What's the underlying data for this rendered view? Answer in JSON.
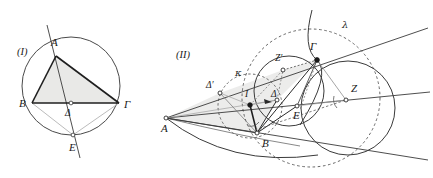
{
  "document": {
    "kind": "geometry-figure-plate",
    "width": 433,
    "height": 178,
    "background_color": "#ffffff"
  },
  "panels": [
    {
      "id": "panel-1",
      "caption": "(I)",
      "caption_x": 17,
      "caption_y": 55,
      "description": "Triangle ABΓ inscribed in a circle with cevian from A through Δ meeting the circle at E"
    },
    {
      "id": "panel-2",
      "caption": "(II)",
      "caption_x": 176,
      "caption_y": 58,
      "description": "Extended configuration with circles kappa and lambda, points A B Γ Δ Δ' E Z Z' I"
    }
  ],
  "figure1": {
    "circle": {
      "cx": 71,
      "cy": 86,
      "r": 49,
      "stroke": "#4a4a4a"
    },
    "triangle_fill": "#e9e9e7",
    "points": [
      {
        "name": "A",
        "label": "Α",
        "x": 56,
        "y": 56,
        "lx": 51,
        "ly": 46,
        "marker": "none"
      },
      {
        "name": "B",
        "label": "Β",
        "x": 32,
        "y": 103,
        "lx": 19,
        "ly": 107,
        "marker": "none"
      },
      {
        "name": "G",
        "label": "Γ",
        "x": 119,
        "y": 103,
        "lx": 124,
        "ly": 108,
        "marker": "none"
      },
      {
        "name": "D",
        "label": "Δ",
        "x": 71,
        "y": 103,
        "lx": 66,
        "ly": 116,
        "marker": "open"
      },
      {
        "name": "E",
        "label": "Ε",
        "x": 73,
        "y": 135,
        "lx": 70,
        "ly": 150,
        "marker": "open"
      }
    ],
    "segments": [
      {
        "from": "A",
        "to": "B",
        "weight": "heavy"
      },
      {
        "from": "A",
        "to": "G",
        "weight": "heavy"
      },
      {
        "from": "B",
        "to": "G",
        "weight": "heavy"
      },
      {
        "from": "B",
        "to": "E",
        "weight": "light"
      },
      {
        "from": "G",
        "to": "E",
        "weight": "light"
      }
    ],
    "cevian": {
      "label": "A-Δ-E extended",
      "weight": "medium"
    }
  },
  "figure2": {
    "points": [
      {
        "name": "A",
        "label": "Α",
        "x": 166,
        "y": 118,
        "lx": 161,
        "ly": 132,
        "marker": "open"
      },
      {
        "name": "B",
        "label": "Β",
        "x": 257,
        "y": 133,
        "lx": 262,
        "ly": 146,
        "marker": "open"
      },
      {
        "name": "G",
        "label": "Γ",
        "x": 317,
        "y": 60,
        "lx": 311,
        "ly": 50,
        "marker": "solid"
      },
      {
        "name": "D",
        "label": "Δ",
        "x": 277,
        "y": 100,
        "lx": 272,
        "ly": 96,
        "marker": "open"
      },
      {
        "name": "Dp",
        "label": "Δ′",
        "x": 220,
        "y": 93,
        "lx": 208,
        "ly": 87,
        "marker": "open"
      },
      {
        "name": "E",
        "label": "Ε",
        "x": 297,
        "y": 106,
        "lx": 294,
        "ly": 118,
        "marker": "open"
      },
      {
        "name": "Z",
        "label": "Ζ",
        "x": 346,
        "y": 100,
        "lx": 350,
        "ly": 91,
        "marker": "open"
      },
      {
        "name": "Zp",
        "label": "Ζ′",
        "x": 283,
        "y": 70,
        "lx": 277,
        "ly": 60,
        "marker": "open"
      },
      {
        "name": "I",
        "label": "Ι",
        "x": 250,
        "y": 105,
        "lx": 246,
        "ly": 96,
        "marker": "solid"
      }
    ],
    "circles": [
      {
        "name": "kappa",
        "label": "κ",
        "cx": 250,
        "cy": 106,
        "r": 32,
        "style": "dashed",
        "lx": 238,
        "ly": 74
      },
      {
        "name": "lambda",
        "label": "λ",
        "cx": 311,
        "cy": 98,
        "r": 69,
        "style": "dashed",
        "lx": 345,
        "ly": 25
      },
      {
        "name": "incircle-right",
        "cx": 348,
        "cy": 108,
        "r": 47,
        "style": "solid"
      },
      {
        "name": "small-solid",
        "cx": 289,
        "cy": 91,
        "r": 35,
        "style": "solid"
      }
    ],
    "shaded_fill": "#e9e9e7"
  },
  "colors": {
    "ink_dark": "#1a1a1a",
    "ink_medium": "#555555",
    "ink_light": "#9a9a9a",
    "shade": "#e9e9e7",
    "paper": "#ffffff"
  }
}
